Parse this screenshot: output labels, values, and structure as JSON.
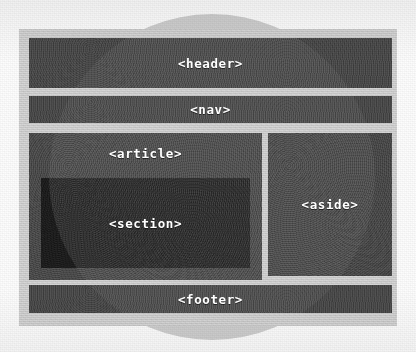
{
  "diagram": {
    "type": "html5-semantic-layout",
    "style": {
      "background": "#fdfdfd",
      "page_frame": "#dcdcdc",
      "block_fill": "#4b4b4b",
      "section_fill": "#1d1d1d",
      "circle_fill": "#cfcfcf",
      "label_color": "#ffffff"
    },
    "background_shape": {
      "name": "background-circle",
      "shape": "circle",
      "center_x": 212,
      "center_y": 177,
      "radius": 163
    },
    "blocks": [
      {
        "id": "header",
        "label": "<header>",
        "x": 29,
        "y": 38,
        "w": 363,
        "h": 50,
        "fill": "#4b4b4b"
      },
      {
        "id": "nav",
        "label": "<nav>",
        "x": 29,
        "y": 96,
        "w": 363,
        "h": 27,
        "fill": "#4b4b4b"
      },
      {
        "id": "article",
        "label": "<article>",
        "x": 29,
        "y": 133,
        "w": 233,
        "h": 147,
        "fill": "#4d4d4d"
      },
      {
        "id": "section",
        "label": "<section>",
        "x": 41,
        "y": 178,
        "w": 209,
        "h": 90,
        "fill": "#1d1d1d"
      },
      {
        "id": "aside",
        "label": "<aside>",
        "x": 268,
        "y": 133,
        "w": 124,
        "h": 143,
        "fill": "#4b4b4b"
      },
      {
        "id": "footer",
        "label": "<footer>",
        "x": 29,
        "y": 285,
        "w": 363,
        "h": 28,
        "fill": "#4b4b4b"
      }
    ],
    "page_frame": {
      "x": 19,
      "y": 29,
      "w": 378,
      "h": 297
    }
  }
}
